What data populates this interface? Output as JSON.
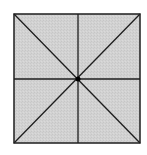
{
  "diagram": {
    "shape": "square",
    "colors": {
      "fill": "#d2d2d2",
      "stroke": "#1e1e1e",
      "background": "#ffffff"
    },
    "square": {
      "x1": 14,
      "y1": 14,
      "x2": 140,
      "y2": 143
    },
    "center": {
      "x": 78,
      "y": 79
    },
    "lines": [
      "diagonal-top-left-to-bottom-right",
      "diagonal-top-right-to-bottom-left",
      "vertical-midline",
      "horizontal-midline"
    ]
  }
}
